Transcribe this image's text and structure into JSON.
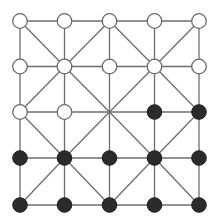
{
  "game": {
    "name": "Alquerque",
    "rows": 5,
    "cols": 5,
    "board": [
      [
        "white",
        "white",
        "white",
        "white",
        "white"
      ],
      [
        "white",
        "white",
        "white",
        "white",
        "white"
      ],
      [
        "white",
        "white",
        "empty",
        "black",
        "black"
      ],
      [
        "black",
        "black",
        "black",
        "black",
        "black"
      ],
      [
        "black",
        "black",
        "black",
        "black",
        "black"
      ]
    ],
    "colors": {
      "line": "#6e6e6e",
      "white_fill": "#ffffff",
      "white_stroke": "#6a6a6a",
      "black_fill": "#2b2b2b",
      "background": "#ffffff"
    },
    "counts": {
      "white": 12,
      "black": 12,
      "empty": 1
    }
  }
}
